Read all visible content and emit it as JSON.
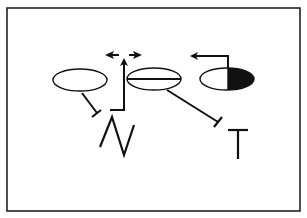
{
  "diagram": {
    "type": "schematic",
    "colors": {
      "stroke": "#111111",
      "fill_dark": "#111111",
      "background": "#ffffff",
      "frame": "#222222"
    },
    "frame": {
      "x": 7,
      "y": 8,
      "width": 293,
      "height": 203
    },
    "nodes": [
      {
        "id": "ellipse-left",
        "shape": "ellipse",
        "cx": 80,
        "cy": 80,
        "rx": 27,
        "ry": 11,
        "style": "open"
      },
      {
        "id": "ellipse-middle",
        "shape": "ellipse",
        "cx": 154,
        "cy": 79,
        "rx": 27,
        "ry": 11,
        "style": "horizontal-bar"
      },
      {
        "id": "ellipse-right",
        "shape": "ellipse",
        "cx": 227,
        "cy": 79,
        "rx": 27,
        "ry": 11,
        "style": "right-half-filled"
      }
    ],
    "edges": [
      {
        "id": "inhibit-left-to-N",
        "kind": "inhibition",
        "from": "ellipse-left",
        "to": "N"
      },
      {
        "id": "activate-N-up",
        "kind": "activation",
        "from": "N",
        "to": "bidirectional-spread"
      },
      {
        "id": "bidirectional-spread",
        "kind": "double-headed-arrow",
        "direction": "left-right"
      },
      {
        "id": "inhibit-middle-to-T",
        "kind": "inhibition",
        "from": "ellipse-middle",
        "to": "T"
      },
      {
        "id": "activate-right-leftward",
        "kind": "activation",
        "from": "ellipse-right",
        "direction": "left"
      }
    ],
    "labels": [
      {
        "id": "label-N",
        "text": "N"
      },
      {
        "id": "label-T",
        "text": "T"
      }
    ]
  },
  "caption": {
    "text": ""
  }
}
